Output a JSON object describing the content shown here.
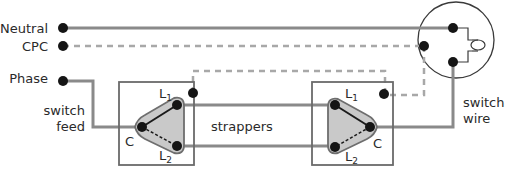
{
  "labels": {
    "neutral": "Neutral",
    "cpc": "CPC",
    "phase": "Phase",
    "switch_feed_1": "switch",
    "switch_feed_2": "feed",
    "strappers": "strappers",
    "switch_wire_1": "switch",
    "switch_wire_2": "wire"
  },
  "left_switch": {
    "common": "C",
    "l1": "L",
    "l1_sub": "1",
    "l2": "L",
    "l2_sub": "2"
  },
  "right_switch": {
    "common": "C",
    "l1": "L",
    "l1_sub": "1",
    "l2": "L",
    "l2_sub": "2"
  },
  "colors": {
    "wire": "#8a8a8a",
    "cpc": "#a8a8a8",
    "terminal": "#151515",
    "switch_body": "#c9c9c9"
  }
}
